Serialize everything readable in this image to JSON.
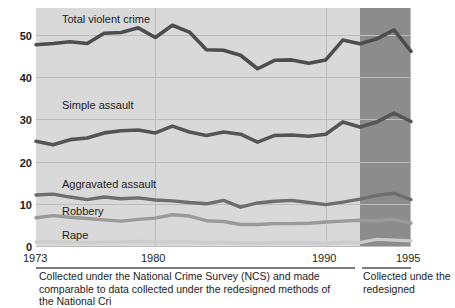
{
  "figure": {
    "background_color": "#ffffff",
    "plot_background_color": "#d9d9d9",
    "redesign_band_color": "#8c8c8c",
    "line_colors": {
      "total_violent_crime": "#4d4d4d",
      "simple_assault": "#555555",
      "aggravated_assault": "#6e6e6e",
      "robbery": "#9a9a9a",
      "rape": "#cccccc"
    }
  },
  "axes": {
    "y_ticks": [
      "0",
      "10",
      "20",
      "30",
      "40",
      "50"
    ],
    "y_min": 0,
    "y_max": 55,
    "x_ticks": [
      "1973",
      "1980",
      "1990",
      "1995"
    ],
    "x_min": 1973,
    "x_max": 1995
  },
  "series_labels": {
    "total": "Total violent crime",
    "simple": "Simple assault",
    "aggravated": "Aggravated assault",
    "robbery": "Robbery",
    "rape": "Rape"
  },
  "captions": {
    "left": "Collected under the National Crime Survey (NCS) and made comparable to data collected under the redesigned methods of the National Cri",
    "right": "Collected unde the redesigned"
  },
  "chart_data": {
    "type": "line",
    "title": "",
    "xlabel": "",
    "ylabel": "",
    "xlim": [
      1973,
      1995
    ],
    "ylim": [
      0,
      55
    ],
    "grid": true,
    "legend": "inline-annotations",
    "x": [
      1973,
      1974,
      1975,
      1976,
      1977,
      1978,
      1979,
      1980,
      1981,
      1982,
      1983,
      1984,
      1985,
      1986,
      1987,
      1988,
      1989,
      1990,
      1991,
      1992,
      1993,
      1994,
      1995
    ],
    "series": [
      {
        "name": "Total violent crime",
        "values": [
          47.7,
          48.0,
          48.4,
          48.0,
          50.4,
          50.6,
          51.7,
          49.4,
          52.3,
          50.7,
          46.5,
          46.4,
          45.2,
          42.0,
          44.0,
          44.1,
          43.3,
          44.1,
          48.8,
          47.9,
          49.1,
          51.2,
          46.1
        ]
      },
      {
        "name": "Simple assault",
        "values": [
          24.8,
          24.0,
          25.2,
          25.6,
          26.8,
          27.3,
          27.5,
          26.8,
          28.4,
          27.0,
          26.2,
          27.0,
          26.5,
          24.6,
          26.2,
          26.3,
          26.0,
          26.5,
          29.4,
          28.2,
          29.4,
          31.5,
          29.5
        ]
      },
      {
        "name": "Aggravated assault",
        "values": [
          12.1,
          12.3,
          11.6,
          11.0,
          11.6,
          11.2,
          11.4,
          10.9,
          10.7,
          10.3,
          10.0,
          10.8,
          9.2,
          10.2,
          10.6,
          10.8,
          10.3,
          9.8,
          10.4,
          11.1,
          12.0,
          12.5,
          11.0
        ]
      },
      {
        "name": "Robbery",
        "values": [
          6.7,
          7.2,
          6.8,
          6.5,
          6.2,
          5.9,
          6.3,
          6.6,
          7.4,
          7.1,
          6.0,
          5.8,
          5.1,
          5.1,
          5.3,
          5.3,
          5.4,
          5.7,
          5.9,
          6.1,
          6.0,
          6.3,
          5.4
        ]
      },
      {
        "name": "Rape",
        "values": [
          1.0,
          1.0,
          0.9,
          0.8,
          0.9,
          1.0,
          1.1,
          0.9,
          1.0,
          1.0,
          0.8,
          0.9,
          0.7,
          0.7,
          0.8,
          0.8,
          0.8,
          0.6,
          0.9,
          0.8,
          1.6,
          1.4,
          1.2
        ]
      }
    ],
    "redesign_band": {
      "from": 1992,
      "to": 1995
    }
  }
}
